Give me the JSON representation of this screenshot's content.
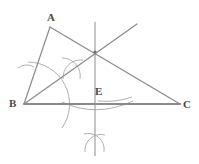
{
  "figure": {
    "canvas": {
      "width": 199,
      "height": 164,
      "background": "#ffffff"
    },
    "colors": {
      "triangle_stroke": "#8a8a8a",
      "construction_stroke": "#a9a9a9",
      "label_text": "#4a4a4a"
    }
  },
  "labels": [
    {
      "id": "A",
      "text": "A",
      "x": 47,
      "y": 12
    },
    {
      "id": "B",
      "text": "B",
      "x": 9,
      "y": 98
    },
    {
      "id": "C",
      "text": "C",
      "x": 183,
      "y": 99
    },
    {
      "id": "E",
      "text": "E",
      "x": 95,
      "y": 86
    }
  ],
  "points": {
    "A": {
      "x": 50,
      "y": 27
    },
    "B": {
      "x": 24,
      "y": 104
    },
    "C": {
      "x": 180,
      "y": 104
    },
    "E": {
      "x": 95,
      "y": 104
    },
    "P": {
      "x": 95,
      "y": 52
    },
    "ray_end": {
      "x": 137,
      "y": 24
    },
    "vline_top": {
      "x": 95,
      "y": 22
    },
    "vline_bottom": {
      "x": 95,
      "y": 156
    },
    "cross_upper": {
      "x": 72,
      "y": 68
    },
    "cross_lower": {
      "x": 95,
      "y": 143
    }
  },
  "segments": [
    {
      "name": "side-ab",
      "x1": 50,
      "y1": 27,
      "x2": 24,
      "y2": 104,
      "stroke": "#8a8a8a",
      "width": 1.2
    },
    {
      "name": "side-ac",
      "x1": 50,
      "y1": 27,
      "x2": 180,
      "y2": 104,
      "stroke": "#8a8a8a",
      "width": 1.2
    },
    {
      "name": "side-bc",
      "x1": 24,
      "y1": 104,
      "x2": 180,
      "y2": 104,
      "stroke": "#8a8a8a",
      "width": 2.0
    },
    {
      "name": "angle-bisector-ray",
      "x1": 24,
      "y1": 104,
      "x2": 137,
      "y2": 24,
      "stroke": "#8a8a8a",
      "width": 1.2
    },
    {
      "name": "perpendicular-bisector",
      "x1": 95,
      "y1": 22,
      "x2": 95,
      "y2": 156,
      "stroke": "#a0a0a0",
      "width": 1.2
    }
  ],
  "arcs": [
    {
      "name": "bisector-arc-at-b-large",
      "d": "M 28 62 A 42 42 0 0 1 62 128",
      "stroke": "#b0b0b0",
      "width": 1.0
    },
    {
      "name": "bisector-tick-on-ab",
      "d": "M 18 68 A 14 14 0 0 1 34 67",
      "stroke": "#b0b0b0",
      "width": 1.0
    },
    {
      "name": "bisector-tick-on-bc",
      "d": "M 98 101 A 80 80 0 0 0 132 97",
      "stroke": "#b0b0b0",
      "width": 1.0
    },
    {
      "name": "arc-cross-upper-a",
      "d": "M 62 58 A 18 18 0 0 1 80 79",
      "stroke": "#b0b0b0",
      "width": 1.0
    },
    {
      "name": "arc-cross-upper-b",
      "d": "M 63 79 A 18 18 0 0 1 83 60",
      "stroke": "#b0b0b0",
      "width": 1.0
    },
    {
      "name": "perp-bisector-arc-below",
      "d": "M 62 102 Q 96 118 133 101",
      "stroke": "#b0b0b0",
      "width": 1.0
    },
    {
      "name": "arc-cross-lower-a",
      "d": "M 84 134 A 16 16 0 0 1 104 152",
      "stroke": "#b0b0b0",
      "width": 1.0
    },
    {
      "name": "arc-cross-lower-b",
      "d": "M 85 152 A 16 16 0 0 1 105 135",
      "stroke": "#b0b0b0",
      "width": 1.0
    }
  ],
  "markers": [
    {
      "name": "concurrency-dot",
      "x": 95,
      "y": 52,
      "r": 1.6,
      "fill": "#6f6f6f"
    }
  ]
}
